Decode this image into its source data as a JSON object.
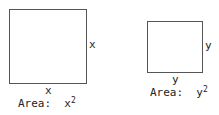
{
  "squares": [
    {
      "side_right_label": "x",
      "side_bottom_label": "x",
      "area_prefix": "Area:  ",
      "area_base": "x",
      "area_exp": "2"
    },
    {
      "side_right_label": "y",
      "side_bottom_label": "y",
      "area_prefix": "Area:  ",
      "area_base": "y",
      "area_exp": "2"
    }
  ]
}
